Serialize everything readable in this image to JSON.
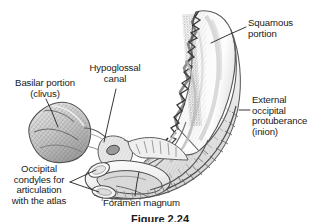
{
  "figure": {
    "kind": "anatomical-illustration",
    "style": "grayscale pen-and-ink line drawing",
    "caption": "Figure 2.24"
  },
  "colors": {
    "background": "#ffffff",
    "ink": "#1a1a1a",
    "leader": "#2b2b2b",
    "bone_fill": "#fbfbfb",
    "bone_shade": "#c9c9c9",
    "bone_shade_dark": "#8d8d8d",
    "hatch": "#6f6f6f",
    "suture_dark": "#3d3d3d"
  },
  "labels": [
    {
      "id": "squamous-portion",
      "text": "Squamous\nportion",
      "align": "left",
      "x": 248,
      "y": 18,
      "width": 70
    },
    {
      "id": "external-occipital-protuberance",
      "text": "External\noccipital\nprotuberance\n(inion)",
      "align": "left",
      "x": 252,
      "y": 95,
      "width": 68
    },
    {
      "id": "basilar-portion-clivus",
      "text": "Basilar portion\n(clivus)",
      "align": "center",
      "x": 2,
      "y": 78,
      "width": 86
    },
    {
      "id": "hypoglossal-canal",
      "text": "Hypoglossal\ncanal",
      "align": "center",
      "x": 79,
      "y": 63,
      "width": 72
    },
    {
      "id": "occipital-condyles",
      "text": "Occipital\ncondyles for\narticulation\nwith the atlas",
      "align": "center",
      "x": 1,
      "y": 164,
      "width": 76
    },
    {
      "id": "foramen-magnum",
      "text": "Foramen magnum",
      "align": "left",
      "x": 103,
      "y": 198,
      "width": 102
    }
  ],
  "leaders": [
    {
      "id": "leader-squamous",
      "points": "246,27 228,35 211,43"
    },
    {
      "id": "leader-external",
      "points": "250,110 239,110"
    },
    {
      "id": "leader-basilar",
      "points": "46,99 52,112 58,127"
    },
    {
      "id": "leader-hypoglossal",
      "points": "116,89 110,115 104,142"
    },
    {
      "id": "leader-condyle-a",
      "points": "70,182 96,170"
    },
    {
      "id": "leader-condyle-b",
      "points": "70,182 99,192"
    },
    {
      "id": "leader-foramen",
      "points": "135,196 137,182 139,172"
    }
  ]
}
